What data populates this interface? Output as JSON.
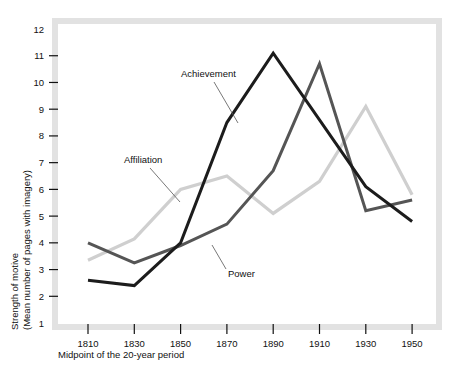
{
  "chart_data": {
    "type": "line",
    "title": "",
    "xlabel": "Midpoint of the 20-year period",
    "ylabel": "Strength of motive\n(Mean number of pages with imagery)",
    "ylabel_line1": "Strength of motive",
    "ylabel_line2": "(Mean number of pages with imagery)",
    "x": [
      1810,
      1830,
      1850,
      1870,
      1890,
      1910,
      1930,
      1950
    ],
    "categories": [
      "1810",
      "1830",
      "1850",
      "1870",
      "1890",
      "1910",
      "1930",
      "1950"
    ],
    "xlim": [
      1800,
      1960
    ],
    "ylim": [
      1,
      12
    ],
    "yticks": [
      1,
      2,
      3,
      4,
      5,
      6,
      7,
      8,
      9,
      10,
      11,
      12
    ],
    "ytick_labels": [
      "1",
      "2",
      "3",
      "4",
      "5",
      "6",
      "7",
      "8",
      "9",
      "10",
      "11",
      "12"
    ],
    "grid": false,
    "legend": "inline-annotations",
    "series": [
      {
        "name": "Achievement",
        "color": "#1c1c1c",
        "values": [
          2.6,
          2.4,
          4.0,
          8.5,
          11.1,
          8.6,
          6.1,
          4.8
        ]
      },
      {
        "name": "Power",
        "color": "#555555",
        "values": [
          4.0,
          3.25,
          3.9,
          4.7,
          6.7,
          10.7,
          5.2,
          5.6
        ]
      },
      {
        "name": "Affiliation",
        "color": "#cfcfcf",
        "values": [
          3.35,
          4.15,
          6.0,
          6.5,
          5.1,
          6.3,
          9.1,
          5.8
        ]
      }
    ],
    "annotations": [
      {
        "name": "Achievement",
        "label_x": 181,
        "label_y": 77,
        "leader": [
          214,
          82,
          238,
          123
        ]
      },
      {
        "name": "Affiliation",
        "label_x": 124,
        "label_y": 163,
        "leader": [
          150,
          168,
          180,
          202
        ]
      },
      {
        "name": "Power",
        "label_x": 228,
        "label_y": 277,
        "leader": [
          226,
          269,
          212,
          245
        ]
      }
    ]
  },
  "colors": {
    "achievement": "#1c1c1c",
    "power": "#555555",
    "affiliation": "#cfcfcf",
    "frame_band": "#e2e2e2",
    "text": "#111111",
    "background": "#ffffff"
  }
}
